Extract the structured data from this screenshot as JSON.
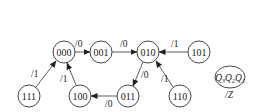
{
  "diagram": {
    "type": "state-transition",
    "nodes": [
      {
        "id": "000",
        "label": "000",
        "x": 64,
        "y": 52
      },
      {
        "id": "001",
        "label": "001",
        "x": 101,
        "y": 52
      },
      {
        "id": "010",
        "label": "010",
        "x": 148,
        "y": 52
      },
      {
        "id": "101",
        "label": "101",
        "x": 199,
        "y": 52
      },
      {
        "id": "111",
        "label": "111",
        "x": 29,
        "y": 96
      },
      {
        "id": "100",
        "label": "100",
        "x": 80,
        "y": 96
      },
      {
        "id": "011",
        "label": "011",
        "x": 128,
        "y": 96
      },
      {
        "id": "110",
        "label": "110",
        "x": 180,
        "y": 96
      }
    ],
    "edges": [
      {
        "from": "000",
        "to": "001",
        "label": "/0"
      },
      {
        "from": "001",
        "to": "010",
        "label": "/0"
      },
      {
        "from": "101",
        "to": "010",
        "label": "/1"
      },
      {
        "from": "010",
        "to": "011",
        "label": "/0"
      },
      {
        "from": "110",
        "to": "010",
        "label": "/1"
      },
      {
        "from": "011",
        "to": "100",
        "label": "/0"
      },
      {
        "from": "100",
        "to": "000",
        "label": "/1"
      },
      {
        "from": "111",
        "to": "000",
        "label": "/1"
      }
    ],
    "legend": {
      "state_label": "Q3Q2Q1",
      "q3": "Q",
      "q3_sub": "3",
      "q2": "Q",
      "q2_sub": "2",
      "q1": "Q",
      "q1_sub": "1",
      "output_label": "/Z"
    }
  }
}
